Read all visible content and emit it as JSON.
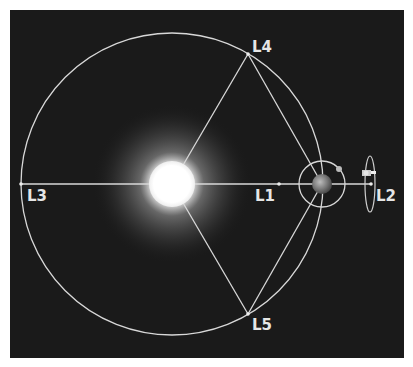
{
  "diagram": {
    "type": "lagrange-points",
    "background_color": "#1a1a1a",
    "line_color": "#d8d8d8",
    "labels": {
      "L1": "L1",
      "L2": "L2",
      "L3": "L3",
      "L4": "L4",
      "L5": "L5"
    },
    "bodies": {
      "sun": "Sun",
      "earth": "Earth",
      "moon": "Moon",
      "satellite": "Satellite"
    }
  }
}
